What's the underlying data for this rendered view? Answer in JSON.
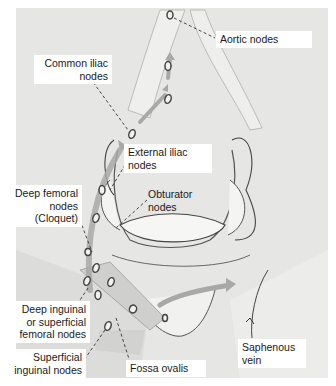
{
  "figure": {
    "type": "anatomical-illustration",
    "colors": {
      "background": "#e6e6e4",
      "tissue": "#f4f4f2",
      "outline": "#4a4a4a",
      "arrow": "#a8a8a8",
      "node": "#555555",
      "label_bg": "#ffffff",
      "label_text": "#1a1a1a"
    }
  },
  "labels": {
    "aortic": "Aortic nodes",
    "common_iliac": {
      "line1": "Common iliac",
      "line2": "nodes"
    },
    "external_iliac": {
      "line1": "External iliac",
      "line2": "nodes"
    },
    "obturator": {
      "line1": "Obturator",
      "line2": "nodes"
    },
    "deep_femoral": {
      "line1": "Deep femoral",
      "line2": "nodes",
      "line3": "(Cloquet)"
    },
    "deep_inguinal": {
      "line1": "Deep inguinal",
      "line2": "or superficial",
      "line3": "femoral nodes"
    },
    "superficial_inguinal": {
      "line1": "Superficial",
      "line2": "inguinal nodes"
    },
    "fossa_ovalis": "Fossa ovalis",
    "saphenous": {
      "line1": "Saphenous",
      "line2": "vein"
    }
  }
}
